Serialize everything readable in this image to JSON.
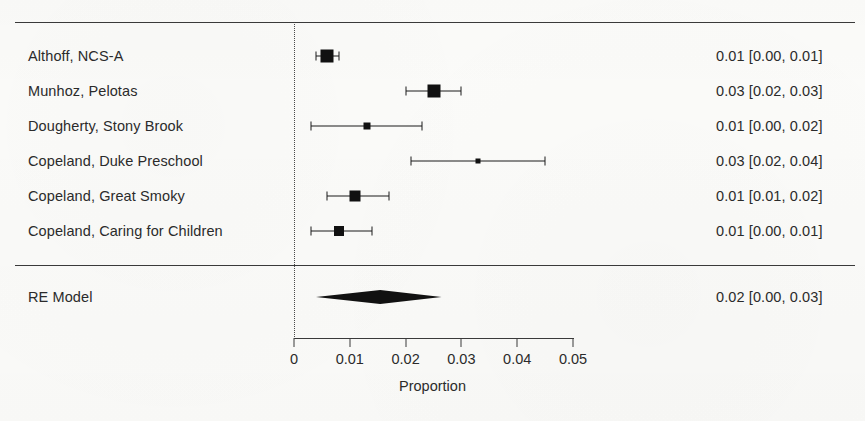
{
  "chart_data": {
    "type": "forest",
    "title": "",
    "xlabel": "Proportion",
    "ylabel": "",
    "xlim": [
      0,
      0.05
    ],
    "xticks": [
      0,
      0.01,
      0.02,
      0.03,
      0.04,
      0.05
    ],
    "xtick_labels": [
      "0",
      "0.01",
      "0.02",
      "0.03",
      "0.04",
      "0.05"
    ],
    "reference_line": 0,
    "grid": false,
    "legend": "none",
    "studies": [
      {
        "label": "Althoff, NCS-A",
        "estimate": 0.006,
        "ci_low": 0.004,
        "ci_high": 0.008,
        "stat_text": "0.01 [0.00, 0.01]",
        "weight_box": 13
      },
      {
        "label": "Munhoz, Pelotas",
        "estimate": 0.025,
        "ci_low": 0.02,
        "ci_high": 0.03,
        "stat_text": "0.03 [0.02, 0.03]",
        "weight_box": 13
      },
      {
        "label": "Dougherty, Stony Brook",
        "estimate": 0.013,
        "ci_low": 0.003,
        "ci_high": 0.023,
        "stat_text": "0.01 [0.00, 0.02]",
        "weight_box": 7
      },
      {
        "label": "Copeland, Duke Preschool",
        "estimate": 0.033,
        "ci_low": 0.021,
        "ci_high": 0.045,
        "stat_text": "0.03 [0.02, 0.04]",
        "weight_box": 5
      },
      {
        "label": "Copeland, Great Smoky",
        "estimate": 0.011,
        "ci_low": 0.006,
        "ci_high": 0.017,
        "stat_text": "0.01 [0.01, 0.02]",
        "weight_box": 11
      },
      {
        "label": "Copeland, Caring for Children",
        "estimate": 0.008,
        "ci_low": 0.003,
        "ci_high": 0.014,
        "stat_text": "0.01 [0.00, 0.01]",
        "weight_box": 10
      }
    ],
    "summary": {
      "label": "RE Model",
      "estimate": 0.0155,
      "ci_low": 0.004,
      "ci_high": 0.0265,
      "stat_text": "0.02 [0.00, 0.03]"
    },
    "colors": {
      "marker": "#111111",
      "line": "#1a1a1a",
      "axis": "#3a3a3a",
      "text": "#2b2b2b",
      "background": "#fbfbf9"
    }
  }
}
